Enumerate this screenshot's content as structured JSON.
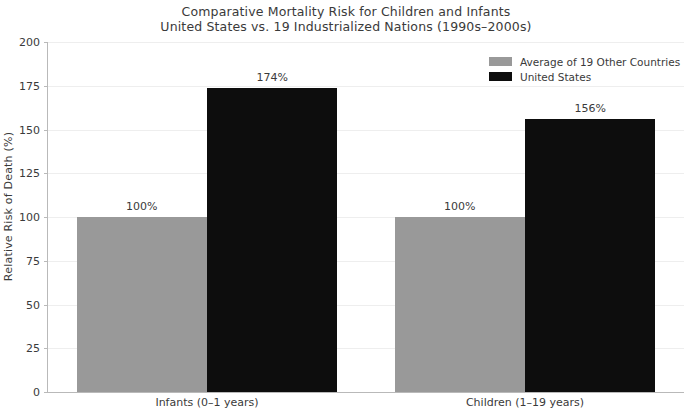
{
  "chart_data": {
    "type": "bar",
    "title": "Comparative Mortality Risk for Children and Infants",
    "subtitle": "United States vs. 19 Industrialized Nations (1990s–2000s)",
    "xlabel": "",
    "ylabel": "Relative Risk of Death (%)",
    "ylim": [
      0,
      200
    ],
    "ytick_step": 25,
    "yticks": [
      "200",
      "175",
      "150",
      "125",
      "100",
      "75",
      "50",
      "25",
      "0"
    ],
    "ytick_values": [
      200,
      175,
      150,
      125,
      100,
      75,
      50,
      25,
      0
    ],
    "grid": true,
    "legend_position": "upper right",
    "categories": [
      "Infants (0–1 years)",
      "Children (1–19 years)"
    ],
    "series": [
      {
        "name": "Average of 19 Other Countries",
        "color": "#999999",
        "values": [
          100,
          100
        ],
        "labels": [
          "100%",
          "100%"
        ]
      },
      {
        "name": "United States",
        "color": "#0d0d0d",
        "values": [
          174,
          156
        ],
        "labels": [
          "174%",
          "156%"
        ]
      }
    ]
  }
}
